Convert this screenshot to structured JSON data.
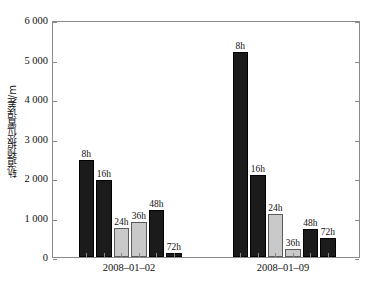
{
  "chart_data": {
    "type": "bar",
    "title": "",
    "xlabel": "",
    "ylabel": "轨道预报位置误差/m",
    "ylim": [
      0,
      6000
    ],
    "ytick_values": [
      0,
      1000,
      2000,
      3000,
      4000,
      5000,
      6000
    ],
    "ytick_labels": [
      "0",
      "1 000",
      "2 000",
      "3 000",
      "4 000",
      "5 000",
      "6 000"
    ],
    "grid": false,
    "legend": null,
    "categories": [
      "2008-01-02",
      "2008-01-09"
    ],
    "category_labels": [
      "2008–01–02",
      "2008–01–09"
    ],
    "bar_labels": [
      "8h",
      "16h",
      "24h",
      "36h",
      "48h",
      "72h"
    ],
    "colors": {
      "dark": "#1b1b1b",
      "light": "#c9c9c9",
      "axis": "#8a8a8a",
      "text": "#111111",
      "background": "#ffffff"
    },
    "bar_styles": [
      "dark",
      "dark",
      "light",
      "light",
      "dark",
      "dark"
    ],
    "groups": [
      {
        "category": "2008–01–02",
        "bars": [
          {
            "label": "8h",
            "value": 2450,
            "style": "dark"
          },
          {
            "label": "16h",
            "value": 1950,
            "style": "dark"
          },
          {
            "label": "24h",
            "value": 730,
            "style": "light"
          },
          {
            "label": "36h",
            "value": 880,
            "style": "light"
          },
          {
            "label": "48h",
            "value": 1180,
            "style": "dark"
          },
          {
            "label": "72h",
            "value": 110,
            "style": "dark"
          }
        ]
      },
      {
        "category": "2008–01–09",
        "bars": [
          {
            "label": "8h",
            "value": 5200,
            "style": "dark"
          },
          {
            "label": "16h",
            "value": 2080,
            "style": "dark"
          },
          {
            "label": "24h",
            "value": 1080,
            "style": "light"
          },
          {
            "label": "36h",
            "value": 200,
            "style": "light"
          },
          {
            "label": "48h",
            "value": 700,
            "style": "dark"
          },
          {
            "label": "72h",
            "value": 490,
            "style": "dark"
          }
        ]
      }
    ],
    "series": [
      {
        "name": "8h",
        "values": [
          2450,
          5200
        ]
      },
      {
        "name": "16h",
        "values": [
          1950,
          2080
        ]
      },
      {
        "name": "24h",
        "values": [
          730,
          1080
        ]
      },
      {
        "name": "36h",
        "values": [
          880,
          200
        ]
      },
      {
        "name": "48h",
        "values": [
          1180,
          700
        ]
      },
      {
        "name": "72h",
        "values": [
          110,
          490
        ]
      }
    ]
  }
}
